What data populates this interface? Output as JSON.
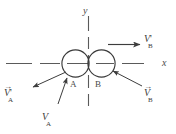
{
  "figure": {
    "background_color": "#ffffff",
    "stroke_color": "#4a4a4a"
  },
  "axes": {
    "x_label": "x",
    "y_label": "y",
    "x_style": "dashed",
    "y_style": "dashed"
  },
  "bodies": [
    {
      "label": "A",
      "name": "circle-a"
    },
    {
      "label": "B",
      "name": "circle-b"
    }
  ],
  "vectors": [
    {
      "name": "v-a-prime",
      "symbol": "V",
      "prime": "'",
      "subscript": "A",
      "direction": "down-left",
      "description": "V'A outgoing velocity of body A"
    },
    {
      "name": "v-a",
      "symbol": "V",
      "prime": "",
      "subscript": "A",
      "direction": "up-left",
      "description": "VA incoming velocity of body A"
    },
    {
      "name": "v-b-prime",
      "symbol": "V",
      "prime": "'",
      "subscript": "B",
      "direction": "right",
      "description": "V'B outgoing velocity of body B"
    },
    {
      "name": "v-b",
      "symbol": "V",
      "prime": "",
      "subscript": "B",
      "direction": "up-left",
      "description": "VB incoming velocity of body B"
    }
  ]
}
